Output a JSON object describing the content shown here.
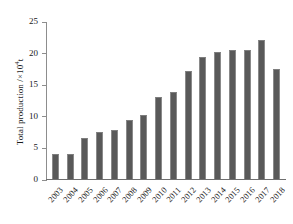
{
  "chart_data": {
    "type": "bar",
    "title": "",
    "xlabel": "",
    "ylabel": "Total production /×10⁴t",
    "ylabel_text": "Total production /",
    "ylabel_unit_base": "×10",
    "ylabel_unit_exp": "4",
    "ylabel_unit_tail": "t",
    "categories": [
      "2003",
      "2004",
      "2005",
      "2006",
      "2007",
      "2008",
      "2009",
      "2010",
      "2011",
      "2012",
      "2013",
      "2014",
      "2015",
      "2016",
      "2017",
      "2018"
    ],
    "values": [
      3.9,
      3.9,
      6.5,
      7.5,
      7.7,
      9.3,
      10.2,
      13.0,
      13.7,
      17.1,
      19.3,
      20.1,
      20.4,
      20.4,
      22.0,
      17.4
    ],
    "ylim": [
      0,
      25
    ],
    "yticks": [
      0,
      5,
      10,
      15,
      20,
      25
    ],
    "ytick_labels": [
      "0",
      "5",
      "10",
      "15",
      "20",
      "25"
    ],
    "grid": false,
    "legend": "none",
    "bar_color": "#595959",
    "axis_color": "#8d8d8d",
    "text_color": "#1a1a1a",
    "background": "#ffffff"
  }
}
